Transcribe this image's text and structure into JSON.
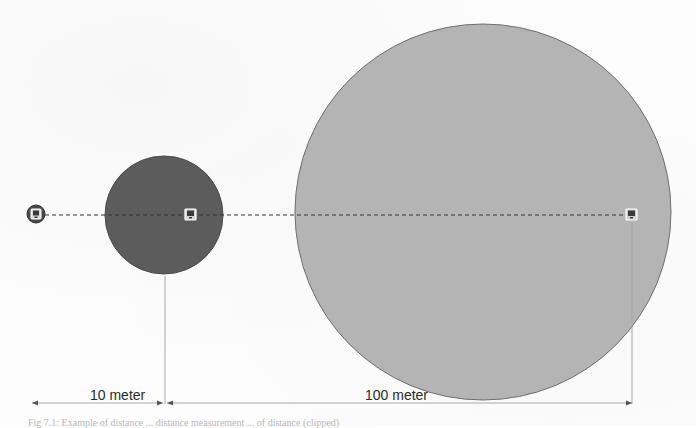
{
  "diagram": {
    "background_color": "#ffffff",
    "circles": [
      {
        "id": "small",
        "cx": 36,
        "cy": 214,
        "r": 9,
        "fill": "#4a4a4a",
        "stroke": "#2f2f2f"
      },
      {
        "id": "medium",
        "cx": 164,
        "cy": 215,
        "r": 59,
        "fill": "#5c5c5c",
        "stroke": "#4a4a4a"
      },
      {
        "id": "large",
        "cx": 483,
        "cy": 212,
        "r": 188,
        "fill": "#b4b4b4",
        "stroke": "#6e6e6e"
      }
    ],
    "markers": [
      {
        "id": "source",
        "x": 36,
        "y": 214,
        "icon": "device-icon"
      },
      {
        "id": "mid",
        "x": 191,
        "y": 215,
        "icon": "device-icon"
      },
      {
        "id": "far",
        "x": 632,
        "y": 215,
        "icon": "device-icon"
      }
    ],
    "dashed_line": {
      "x1": 45,
      "x2": 626,
      "y": 215,
      "color": "#333333"
    },
    "dimensions": [
      {
        "label": "10 meter",
        "x1": 32,
        "x2": 165,
        "y": 403,
        "label_x": 90,
        "label_y": 388
      },
      {
        "label": "100 meter",
        "x1": 165,
        "x2": 632,
        "y": 403,
        "label_x": 365,
        "label_y": 388
      }
    ],
    "extension_lines": [
      {
        "x": 165,
        "y1": 276,
        "y2": 404
      },
      {
        "x": 632,
        "y1": 222,
        "y2": 404
      }
    ],
    "colors": {
      "dimension_line": "#a8a8a8",
      "arrowhead": "#555555",
      "label_text": "#2a2a2a"
    }
  },
  "labels": {
    "dim_10": "10 meter",
    "dim_100": "100 meter"
  },
  "caption": {
    "text": "Fig 7.1: Example of distance ... distance measurement ... of distance (clipped)"
  }
}
